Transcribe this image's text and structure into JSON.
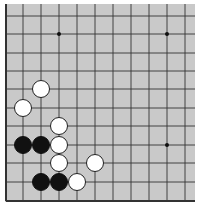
{
  "board": {
    "background": "#c9c9c9",
    "line_color": "#333333",
    "area": {
      "x": 5,
      "y": 4,
      "w": 190,
      "h": 198
    },
    "grid": {
      "columns_x": [
        6,
        23,
        41,
        59,
        77,
        95,
        113,
        131,
        149,
        167,
        185
      ],
      "rows_y": [
        16,
        34,
        53,
        71,
        89,
        108,
        126,
        145,
        163,
        182,
        201
      ],
      "left_edge": true,
      "bottom_edge": true,
      "top_edge": false,
      "right_edge": false
    },
    "star_points": [
      {
        "col": 3,
        "row": 1
      },
      {
        "col": 9,
        "row": 1
      },
      {
        "col": 9,
        "row": 7
      }
    ],
    "stones": [
      {
        "color": "white",
        "col": 2,
        "row": 4
      },
      {
        "color": "white",
        "col": 1,
        "row": 5
      },
      {
        "color": "white",
        "col": 3,
        "row": 6
      },
      {
        "color": "black",
        "col": 1,
        "row": 7
      },
      {
        "color": "black",
        "col": 2,
        "row": 7
      },
      {
        "color": "white",
        "col": 3,
        "row": 7
      },
      {
        "color": "white",
        "col": 3,
        "row": 8
      },
      {
        "color": "white",
        "col": 5,
        "row": 8
      },
      {
        "color": "black",
        "col": 2,
        "row": 9
      },
      {
        "color": "black",
        "col": 3,
        "row": 9
      },
      {
        "color": "white",
        "col": 4,
        "row": 9
      }
    ],
    "stone_radius": 8.5,
    "colors": {
      "black": "#111111",
      "white": "#ffffff",
      "white_stroke": "#222222"
    }
  }
}
